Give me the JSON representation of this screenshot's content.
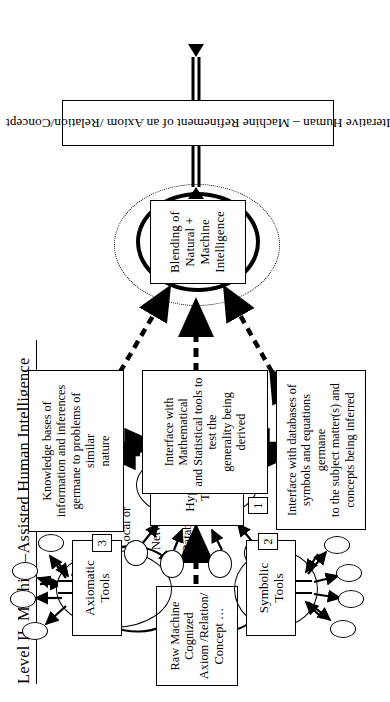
{
  "figure": {
    "title": "Level  II.  Machine–Assisted Human Intelligence",
    "domain_note": "flow-diagram"
  },
  "nodes": {
    "raw_input": {
      "name": "raw-input-box",
      "line1": "Raw Machine Cognized",
      "line2": "Axiom /Relation/ Concept …"
    },
    "databases_label": {
      "name": "local-or-network-databases-label",
      "line1": "Local or",
      "line2": "Network",
      "line3": "Databases"
    },
    "axiomatic_tools": {
      "name": "axiomatic-tools-node",
      "line1": "Axiomatic",
      "line2": "Tools"
    },
    "hypothesis_testing": {
      "name": "hypothesis-testing-node",
      "line1": "Hypothesis",
      "line2": "Testing"
    },
    "symbolic_tools": {
      "name": "symbolic-tools-node",
      "line1": "Symbolic",
      "line2": "Tools"
    },
    "blending": {
      "name": "blending-node",
      "line1": "Blending of Natural +",
      "line2": "Machine Intelligence"
    },
    "bottom_bar": {
      "name": "iterative-refinement-bar",
      "text": "Iterative Human – Machine Refinement of an Axiom /Relation/Concept"
    }
  },
  "callouts": [
    {
      "marker": "1",
      "name": "callout-hypothesis-interface",
      "lines": [
        "Interface with Mathematical",
        "and Statistical tools to test the",
        "generality being derived"
      ]
    },
    {
      "marker": "2",
      "name": "callout-symbolic-interface",
      "lines": [
        "Interface with databases of",
        "symbols and equations germane",
        "to the subject matter(s) and",
        "concepts being inferred"
      ]
    },
    {
      "marker": "3",
      "name": "callout-knowledge-bases",
      "lines": [
        "Knowledge bases of",
        "information and inferences",
        "germane to problems of similar",
        "nature"
      ]
    }
  ],
  "satellites": {
    "axiomatic_count": 4,
    "symbolic_count": 4,
    "hypothesis_count": 4
  },
  "colors": {
    "stroke": "#000000",
    "background": "#ffffff"
  }
}
